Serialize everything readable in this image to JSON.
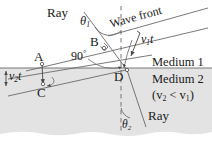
{
  "figure": {
    "title_alt": "Refraction of a wave front at the boundary between two media",
    "colors": {
      "line": "#555555",
      "text": "#1a1a1a",
      "medium2_fill": "#e3e3e3",
      "background": "#ffffff"
    },
    "labels": {
      "ray_top": "Ray",
      "ray_bottom": "Ray",
      "wave_front": "Wave front",
      "medium1": "Medium 1",
      "medium2": "Medium 2",
      "speed_relation": "(v",
      "speed_relation_sub1": "2",
      "speed_relation_mid": " < v",
      "speed_relation_sub2": "1",
      "speed_relation_end": ")",
      "point_a": "A",
      "point_b": "B",
      "point_c": "C",
      "point_d": "D",
      "right_angle": "90",
      "right_angle_sup": "°",
      "theta1": "θ",
      "theta1_sub": "1",
      "theta2": "θ",
      "theta2_sub": "2",
      "v1t": "v",
      "v1t_sub": "1",
      "v1t_t": "t",
      "v2t": "v",
      "v2t_sub": "2",
      "v2t_t": "t"
    }
  }
}
